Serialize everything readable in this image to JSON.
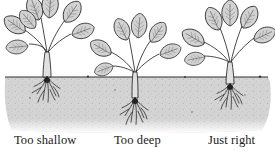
{
  "figure": {
    "style": "black-and-white pen illustration",
    "colors": {
      "background": "#ffffff",
      "ink": "#1a1a1a",
      "soil": "#d9d9d9",
      "soil_dark": "#bdbdbd",
      "leaf_fill": "#cfcfcf"
    },
    "soil_line_y": 77,
    "plants": [
      {
        "id": "too-shallow",
        "caption": "Too shallow",
        "center_x": 47,
        "crown_position": "above soil, roots exposed"
      },
      {
        "id": "too-deep",
        "caption": "Too deep",
        "center_x": 135,
        "crown_position": "buried below soil"
      },
      {
        "id": "just-right",
        "caption": "Just right",
        "center_x": 230,
        "crown_position": "at soil level"
      }
    ]
  }
}
